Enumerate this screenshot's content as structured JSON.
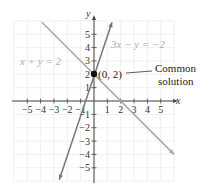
{
  "chart_data": {
    "type": "line",
    "title": "",
    "xlabel": "x",
    "ylabel": "y",
    "xlim": [
      -6,
      6
    ],
    "ylim": [
      -6,
      6
    ],
    "grid": true,
    "x_ticks": [
      -5,
      -4,
      -3,
      -2,
      -1,
      1,
      2,
      3,
      4,
      5
    ],
    "y_ticks": [
      -5,
      -4,
      -3,
      -2,
      -1,
      1,
      2,
      3,
      4,
      5
    ],
    "x_tick_labels": [
      "−5",
      "−4",
      "−3",
      "−2",
      "−1",
      "1",
      "2",
      "3",
      "4",
      "5"
    ],
    "y_tick_labels": [
      "−5",
      "−4",
      "−3",
      "−2",
      "−1",
      "1",
      "2",
      "3",
      "4",
      "5"
    ],
    "series": [
      {
        "name": "x + y = 2",
        "equation": "y = -x + 2",
        "color": "#a8a8a8",
        "x": [
          -3.9,
          6
        ],
        "y": [
          5.9,
          -4
        ]
      },
      {
        "name": "3x − y = −2",
        "equation": "y = 3x + 2",
        "color": "#777777",
        "x": [
          -2.6,
          1.35
        ],
        "y": [
          -5.9,
          5.9
        ]
      }
    ],
    "points": [
      {
        "x": 0,
        "y": 2,
        "label": "(0, 2)",
        "color": "#111111"
      }
    ],
    "annotations": [
      {
        "text": "Common solution",
        "target": "(0, 2)"
      }
    ]
  },
  "labels": {
    "eq1": "x + y = 2",
    "eq2": "3x − y = −2",
    "point": "(0, 2)",
    "annot_line1": "Common",
    "annot_line2": "solution",
    "x_axis": "x",
    "y_axis": "y"
  }
}
